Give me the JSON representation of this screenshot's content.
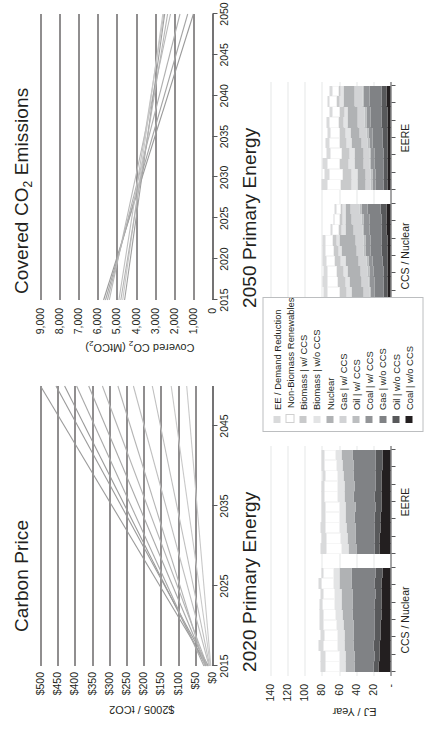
{
  "figure": {
    "orientation": "rotated-90-ccw",
    "background": "#ffffff"
  },
  "panels": {
    "carbon_price": {
      "title": "Carbon Price",
      "ylabel": "$2005 / tCO2",
      "yticks": [
        "$500",
        "$450",
        "$400",
        "$350",
        "$300",
        "$250",
        "$200",
        "$150",
        "$100",
        "$50",
        "$0"
      ],
      "xticks": [
        "2015",
        "2025",
        "2035",
        "2045"
      ]
    },
    "covered_co2": {
      "title": "Covered CO2 Emissions",
      "ylabel": "Covered CO2 (MtCO2)",
      "yticks": [
        "9,000",
        "8,000",
        "7,000",
        "6,000",
        "5,000",
        "4,000",
        "3,000",
        "2,000",
        "1,000",
        "0"
      ],
      "xticks": [
        "2015",
        "2020",
        "2025",
        "2030",
        "2035",
        "2040",
        "2045",
        "2050"
      ]
    },
    "pe_2020": {
      "title": "2020 Primary Energy",
      "ylabel": "EJ / Year",
      "yticks": [
        "140",
        "120",
        "100",
        "80",
        "60",
        "40",
        "20",
        "-"
      ],
      "groups": [
        "CCS / Nuclear",
        "EERE"
      ]
    },
    "pe_2050": {
      "title": "2050 Primary Energy",
      "ylabel": "EJ / Year",
      "yticks": [
        "140",
        "120",
        "100",
        "80",
        "60",
        "40",
        "20",
        "-"
      ],
      "groups": [
        "CCS / Nuclear",
        "EERE"
      ]
    }
  },
  "legend": {
    "items": [
      {
        "label": "EE / Demand Reduction",
        "color": "#d9dadb"
      },
      {
        "label": "Non-Biomass Renewables",
        "color": "#ffffff"
      },
      {
        "label": "Biomass | w/ CCS",
        "color": "#c9cacb"
      },
      {
        "label": "Biomass | w/o CCS",
        "color": "#e3e4e5"
      },
      {
        "label": "Nuclear",
        "color": "#b0b2b4"
      },
      {
        "label": "Gas | w/ CCS",
        "color": "#d2d3d5"
      },
      {
        "label": "Oil | w/ CCS",
        "color": "#bcbec0"
      },
      {
        "label": "Coal | w/ CCS",
        "color": "#939598"
      },
      {
        "label": "Gas | w/o CCS",
        "color": "#808285"
      },
      {
        "label": "Oil | w/o CCS",
        "color": "#58595b"
      },
      {
        "label": "Coal | w/o CCS",
        "color": "#231f20"
      }
    ]
  },
  "chart_data": [
    {
      "type": "line",
      "id": "carbon-price",
      "title": "Carbon Price",
      "xlabel": "",
      "ylabel": "$2005 / tCO2",
      "xlim": [
        2015,
        2050
      ],
      "ylim": [
        0,
        500
      ],
      "xticks": [
        2015,
        2025,
        2035,
        2045
      ],
      "yticks": [
        0,
        50,
        100,
        150,
        200,
        250,
        300,
        350,
        400,
        450,
        500
      ],
      "grid": true,
      "legend": "none",
      "series": [
        {
          "name": "s1",
          "color": "#9a9a9a",
          "x": [
            2015,
            2050
          ],
          "y": [
            14,
            500
          ]
        },
        {
          "name": "s2",
          "color": "#9a9a9a",
          "x": [
            2015,
            2050
          ],
          "y": [
            12,
            455
          ]
        },
        {
          "name": "s3",
          "color": "#9a9a9a",
          "x": [
            2015,
            2050
          ],
          "y": [
            20,
            430
          ]
        },
        {
          "name": "s4",
          "color": "#a8a8a8",
          "x": [
            2015,
            2050
          ],
          "y": [
            25,
            395
          ]
        },
        {
          "name": "s5",
          "color": "#a8a8a8",
          "x": [
            2015,
            2050
          ],
          "y": [
            18,
            360
          ]
        },
        {
          "name": "s6",
          "color": "#b4b4b4",
          "x": [
            2015,
            2050
          ],
          "y": [
            15,
            320
          ]
        },
        {
          "name": "s7",
          "color": "#b4b4b4",
          "x": [
            2015,
            2050
          ],
          "y": [
            22,
            275
          ]
        },
        {
          "name": "s8",
          "color": "#bfbfbf",
          "x": [
            2015,
            2050
          ],
          "y": [
            10,
            230
          ]
        },
        {
          "name": "s9",
          "color": "#bfbfbf",
          "x": [
            2015,
            2050
          ],
          "y": [
            8,
            175
          ]
        },
        {
          "name": "s10",
          "color": "#c9c9c9",
          "x": [
            2015,
            2050
          ],
          "y": [
            6,
            120
          ]
        },
        {
          "name": "s11",
          "color": "#c9c9c9",
          "x": [
            2015,
            2050
          ],
          "y": [
            5,
            75
          ]
        }
      ]
    },
    {
      "type": "line",
      "id": "covered-co2",
      "title": "Covered CO2 Emissions",
      "xlabel": "",
      "ylabel": "Covered CO2 (MtCO2)",
      "xlim": [
        2015,
        2050
      ],
      "ylim": [
        0,
        9000
      ],
      "xticks": [
        2015,
        2020,
        2025,
        2030,
        2035,
        2040,
        2045,
        2050
      ],
      "yticks": [
        0,
        1000,
        2000,
        3000,
        4000,
        5000,
        6000,
        7000,
        8000,
        9000
      ],
      "grid": true,
      "legend": "none",
      "series": [
        {
          "name": "c1",
          "color": "#9a9a9a",
          "x": [
            2015,
            2050
          ],
          "y": [
            5700,
            1000
          ]
        },
        {
          "name": "c2",
          "color": "#a5a5a5",
          "x": [
            2015,
            2050
          ],
          "y": [
            5600,
            1300
          ]
        },
        {
          "name": "c3",
          "color": "#b0b0b0",
          "x": [
            2015,
            2050
          ],
          "y": [
            5500,
            1700
          ]
        },
        {
          "name": "c4",
          "color": "#b8b8b8",
          "x": [
            2015,
            2050
          ],
          "y": [
            5400,
            2200
          ]
        },
        {
          "name": "c5",
          "color": "#c0c0c0",
          "x": [
            2015,
            2050
          ],
          "y": [
            4900,
            2550
          ]
        },
        {
          "name": "c6",
          "color": "#c8c8c8",
          "x": [
            2015,
            2050
          ],
          "y": [
            4700,
            2600
          ]
        },
        {
          "name": "c7",
          "color": "#a0a0a0",
          "x": [
            2015,
            2050
          ],
          "y": [
            4600,
            2500
          ]
        },
        {
          "name": "c8",
          "color": "#b5b5b5",
          "x": [
            2015,
            2050
          ],
          "y": [
            4800,
            2350
          ]
        }
      ]
    },
    {
      "type": "area",
      "id": "primary-energy-2020",
      "title": "2020 Primary Energy",
      "ylabel": "EJ / Year",
      "ylim": [
        0,
        140
      ],
      "yticks": [
        0,
        20,
        40,
        60,
        80,
        100,
        120,
        140
      ],
      "groups": [
        "CCS / Nuclear",
        "EERE"
      ],
      "stack_order": [
        "Coal | w/o CCS",
        "Oil | w/o CCS",
        "Gas | w/o CCS",
        "Coal | w/ CCS",
        "Oil | w/ CCS",
        "Gas | w/ CCS",
        "Nuclear",
        "Biomass | w/o CCS",
        "Biomass | w/ CCS",
        "Non-Biomass Renewables",
        "EE / Demand Reduction"
      ],
      "ccs_nuclear": [
        {
          "x": 1,
          "v": [
            14,
            6,
            22,
            0,
            0,
            0,
            10,
            8,
            0,
            16,
            6
          ]
        },
        {
          "x": 2,
          "v": [
            13,
            6,
            23,
            0,
            0,
            0,
            10,
            8,
            0,
            16,
            6
          ]
        },
        {
          "x": 3,
          "v": [
            13,
            7,
            23,
            0,
            0,
            0,
            11,
            8,
            0,
            16,
            6
          ]
        },
        {
          "x": 4,
          "v": [
            12,
            7,
            24,
            0,
            0,
            0,
            11,
            8,
            0,
            15,
            5
          ]
        },
        {
          "x": 5,
          "v": [
            12,
            7,
            24,
            0,
            0,
            0,
            12,
            8,
            0,
            15,
            5
          ]
        },
        {
          "x": 6,
          "v": [
            11,
            8,
            25,
            0,
            0,
            0,
            12,
            8,
            0,
            14,
            5
          ]
        },
        {
          "x": 7,
          "v": [
            11,
            8,
            25,
            0,
            0,
            0,
            13,
            8,
            0,
            14,
            4
          ]
        },
        {
          "x": 8,
          "v": [
            10,
            8,
            26,
            0,
            0,
            0,
            13,
            8,
            0,
            13,
            4
          ]
        },
        {
          "x": 9,
          "v": [
            10,
            9,
            26,
            0,
            0,
            0,
            14,
            8,
            0,
            13,
            4
          ]
        },
        {
          "x": 10,
          "v": [
            9,
            9,
            27,
            0,
            0,
            0,
            14,
            7,
            0,
            12,
            3
          ]
        }
      ],
      "eere": [
        {
          "x": 1,
          "v": [
            13,
            6,
            21,
            0,
            0,
            0,
            9,
            8,
            0,
            18,
            7
          ]
        },
        {
          "x": 2,
          "v": [
            13,
            6,
            22,
            0,
            0,
            0,
            9,
            8,
            0,
            17,
            6
          ]
        },
        {
          "x": 3,
          "v": [
            12,
            7,
            22,
            0,
            0,
            0,
            10,
            8,
            0,
            17,
            6
          ]
        },
        {
          "x": 4,
          "v": [
            12,
            7,
            23,
            0,
            0,
            0,
            10,
            8,
            0,
            16,
            5
          ]
        },
        {
          "x": 5,
          "v": [
            11,
            7,
            23,
            0,
            0,
            0,
            11,
            8,
            0,
            16,
            5
          ]
        },
        {
          "x": 6,
          "v": [
            11,
            8,
            24,
            0,
            0,
            0,
            11,
            8,
            0,
            15,
            4
          ]
        },
        {
          "x": 7,
          "v": [
            10,
            8,
            24,
            0,
            0,
            0,
            12,
            8,
            0,
            15,
            4
          ]
        },
        {
          "x": 8,
          "v": [
            10,
            8,
            25,
            0,
            0,
            0,
            12,
            7,
            0,
            14,
            3
          ]
        },
        {
          "x": 9,
          "v": [
            9,
            9,
            25,
            0,
            0,
            0,
            13,
            7,
            0,
            14,
            3
          ]
        },
        {
          "x": 10,
          "v": [
            9,
            9,
            26,
            0,
            0,
            0,
            13,
            7,
            0,
            13,
            3
          ]
        }
      ]
    },
    {
      "type": "area",
      "id": "primary-energy-2050",
      "title": "2050 Primary Energy",
      "ylabel": "EJ / Year",
      "ylim": [
        0,
        140
      ],
      "yticks": [
        0,
        20,
        40,
        60,
        80,
        100,
        120,
        140
      ],
      "groups": [
        "CCS / Nuclear",
        "EERE"
      ],
      "stack_order": [
        "Coal | w/o CCS",
        "Oil | w/o CCS",
        "Gas | w/o CCS",
        "Coal | w/ CCS",
        "Oil | w/ CCS",
        "Gas | w/ CCS",
        "Nuclear",
        "Biomass | w/o CCS",
        "Biomass | w/ CCS",
        "Non-Biomass Renewables",
        "EE / Demand Reduction"
      ],
      "ccs_nuclear": [
        {
          "x": 1,
          "v": [
            3,
            5,
            10,
            4,
            2,
            7,
            12,
            6,
            10,
            14,
            6
          ]
        },
        {
          "x": 2,
          "v": [
            3,
            5,
            11,
            4,
            2,
            7,
            13,
            6,
            9,
            13,
            5
          ]
        },
        {
          "x": 3,
          "v": [
            3,
            5,
            11,
            5,
            2,
            8,
            14,
            5,
            9,
            12,
            5
          ]
        },
        {
          "x": 4,
          "v": [
            3,
            5,
            12,
            5,
            2,
            8,
            15,
            5,
            8,
            11,
            4
          ]
        },
        {
          "x": 5,
          "v": [
            4,
            5,
            12,
            5,
            2,
            9,
            16,
            5,
            7,
            10,
            4
          ]
        },
        {
          "x": 6,
          "v": [
            4,
            6,
            13,
            6,
            2,
            9,
            17,
            4,
            6,
            9,
            3
          ]
        },
        {
          "x": 7,
          "v": [
            4,
            6,
            13,
            6,
            2,
            10,
            18,
            4,
            5,
            8,
            3
          ]
        },
        {
          "x": 8,
          "v": [
            5,
            6,
            14,
            6,
            2,
            10,
            10,
            4,
            4,
            7,
            2
          ]
        },
        {
          "x": 9,
          "v": [
            5,
            6,
            14,
            7,
            2,
            11,
            8,
            3,
            3,
            6,
            2
          ]
        },
        {
          "x": 10,
          "v": [
            5,
            7,
            15,
            7,
            2,
            11,
            6,
            3,
            2,
            5,
            2
          ]
        }
      ],
      "eere": [
        {
          "x": 1,
          "v": [
            3,
            5,
            10,
            3,
            2,
            6,
            9,
            8,
            12,
            16,
            7
          ]
        },
        {
          "x": 2,
          "v": [
            3,
            5,
            10,
            3,
            2,
            6,
            9,
            7,
            11,
            15,
            6
          ]
        },
        {
          "x": 3,
          "v": [
            3,
            5,
            11,
            4,
            2,
            7,
            10,
            7,
            10,
            14,
            6
          ]
        },
        {
          "x": 4,
          "v": [
            3,
            5,
            11,
            4,
            2,
            7,
            10,
            6,
            9,
            13,
            5
          ]
        },
        {
          "x": 5,
          "v": [
            4,
            5,
            12,
            4,
            2,
            7,
            11,
            6,
            8,
            12,
            5
          ]
        },
        {
          "x": 6,
          "v": [
            4,
            5,
            12,
            5,
            2,
            8,
            11,
            5,
            7,
            11,
            4
          ]
        },
        {
          "x": 7,
          "v": [
            4,
            6,
            13,
            5,
            2,
            8,
            12,
            5,
            6,
            10,
            4
          ]
        },
        {
          "x": 8,
          "v": [
            4,
            6,
            13,
            5,
            2,
            8,
            12,
            4,
            5,
            9,
            3
          ]
        },
        {
          "x": 9,
          "v": [
            5,
            6,
            14,
            6,
            2,
            9,
            13,
            4,
            4,
            8,
            3
          ]
        },
        {
          "x": 10,
          "v": [
            5,
            6,
            14,
            6,
            2,
            9,
            13,
            3,
            3,
            7,
            3
          ]
        }
      ]
    }
  ]
}
